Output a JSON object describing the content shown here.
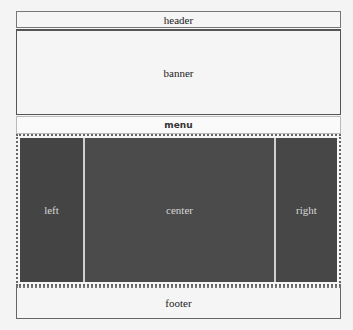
{
  "layout": {
    "header": {
      "label": "header"
    },
    "banner": {
      "label": "banner"
    },
    "menu": {
      "label": "menu"
    },
    "content": {
      "left": {
        "label": "left"
      },
      "center": {
        "label": "center"
      },
      "right": {
        "label": "right"
      }
    },
    "footer": {
      "label": "footer"
    }
  },
  "colors": {
    "page_background": "#f4f4f4",
    "panel_background": "#4a4a4a",
    "panel_text": "#d6d6d6",
    "border": "#666666"
  }
}
